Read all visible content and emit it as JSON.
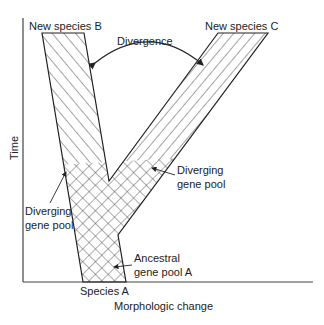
{
  "diagram": {
    "labels": {
      "species_b": "New species B",
      "species_c": "New species C",
      "divergence": "Divergence",
      "diverging_left_1": "Diverging",
      "diverging_left_2": "gene pool",
      "diverging_right_1": "Diverging",
      "diverging_right_2": "gene pool",
      "ancestral_1": "Ancestral",
      "ancestral_2": "gene pool A",
      "species_a": "Species A"
    },
    "axes": {
      "y_label": "Time",
      "x_label": "Morphologic change"
    },
    "colors": {
      "line": "#222222",
      "hatch": "#333333",
      "background": "#ffffff"
    }
  }
}
